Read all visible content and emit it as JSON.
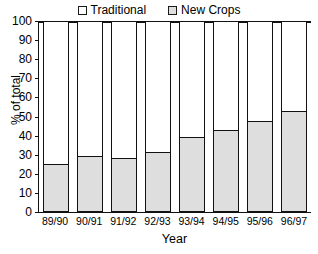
{
  "chart_data": {
    "type": "bar",
    "subtype": "stacked-100-percent",
    "title": "",
    "xlabel": "Year",
    "ylabel": "% of total",
    "ylim": [
      0,
      100
    ],
    "ytick_step": 10,
    "yticks": [
      100,
      90,
      80,
      70,
      60,
      50,
      40,
      30,
      20,
      10,
      0
    ],
    "grid": false,
    "legend_position": "top-center",
    "categories": [
      "89/90",
      "90/91",
      "91/92",
      "92/93",
      "93/94",
      "94/95",
      "95/96",
      "96/97"
    ],
    "series": [
      {
        "name": "Traditional",
        "color": "#ffffff",
        "values": [
          75,
          71,
          72,
          69,
          61,
          57,
          52.5,
          47
        ]
      },
      {
        "name": "New Crops",
        "color": "#dedede",
        "values": [
          25,
          29,
          28,
          31,
          39,
          43,
          47.5,
          53
        ]
      }
    ]
  },
  "legend": {
    "entries": [
      {
        "label": "Traditional",
        "swatch": "white-square-icon"
      },
      {
        "label": "New Crops",
        "swatch": "gray-square-icon"
      }
    ]
  },
  "axes": {
    "y_title": "% of total",
    "x_title": "Year",
    "y_ticks": [
      "100",
      "90",
      "80",
      "70",
      "60",
      "50",
      "40",
      "30",
      "20",
      "10",
      "0"
    ],
    "x_ticks": [
      "89/90",
      "90/91",
      "91/92",
      "92/93",
      "93/94",
      "94/95",
      "95/96",
      "96/97"
    ]
  },
  "colors": {
    "axis": "#111111",
    "traditional_fill": "#ffffff",
    "new_crops_fill": "#dedede",
    "background": "#ffffff"
  }
}
